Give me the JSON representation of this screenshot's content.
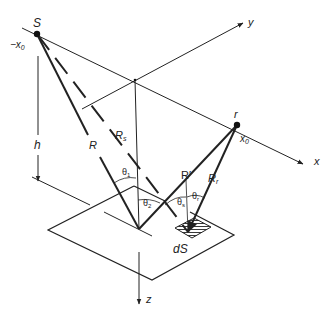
{
  "diagram": {
    "colors": {
      "line": "#222222",
      "background": "#ffffff"
    },
    "axes": {
      "x": {
        "label": "x"
      },
      "y": {
        "label": "y"
      },
      "z": {
        "label": "z"
      }
    },
    "points": {
      "source": {
        "label": "S",
        "coord_label": "−x",
        "coord_sub": "0"
      },
      "receiver": {
        "label": "r",
        "coord_label": "x",
        "coord_sub": "0"
      }
    },
    "distances": {
      "R": "R",
      "Rs": {
        "main": "R",
        "sub": "s"
      },
      "Rprime": "R′",
      "Rr": {
        "main": "R",
        "sub": "r"
      },
      "h": "h"
    },
    "angles": {
      "theta1": {
        "main": "θ",
        "sub": "1"
      },
      "theta2": {
        "main": "θ",
        "sub": "2"
      },
      "theta_s": {
        "main": "θ",
        "sub": "s"
      },
      "theta_r": {
        "main": "θ",
        "sub": "r"
      }
    },
    "surface_element": {
      "label": "dS"
    }
  }
}
